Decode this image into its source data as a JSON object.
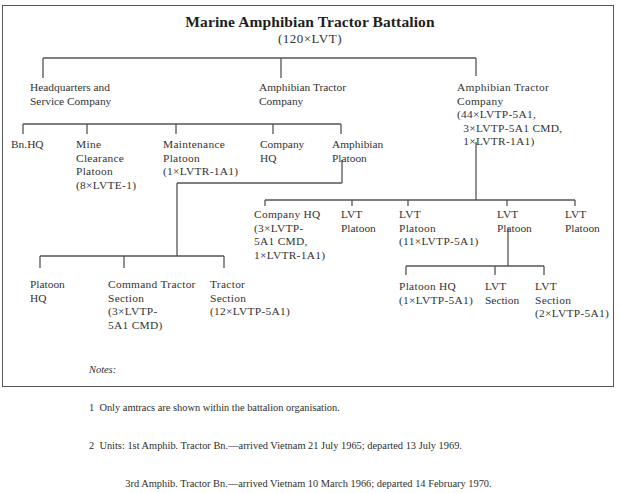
{
  "diagram": {
    "title": "Marine Amphibian Tractor Battalion",
    "subtitle": "(120×LVT)",
    "level1": [
      {
        "id": "hq_service_company",
        "label": "Headquarters and\nService Company"
      },
      {
        "id": "amphib_tractor_company_a",
        "label": "Amphibian Tractor\nCompany"
      },
      {
        "id": "amphib_tractor_company_b",
        "label": "Amphibian Tractor\nCompany\n(44×LVTP-5A1,\n  3×LVTP-5A1 CMD,\n  1×LVTR-1A1)"
      }
    ],
    "level2_hq_service": [
      {
        "id": "bn_hq",
        "label": "Bn.HQ"
      },
      {
        "id": "mine_clearance_platoon",
        "label": "Mine\nClearance\nPlatoon\n(8×LVTE-1)"
      },
      {
        "id": "maintenance_platoon",
        "label": "Maintenance\nPlatoon\n(1×LVTR-1A1)"
      },
      {
        "id": "company_hq_a",
        "label": "Company\nHQ"
      },
      {
        "id": "amphibian_platoon",
        "label": "Amphibian\nPlatoon"
      }
    ],
    "level2_company_b": [
      {
        "id": "company_hq_b",
        "label": "Company HQ\n(3×LVTP-\n5A1 CMD,\n1×LVTR-1A1)"
      },
      {
        "id": "lvt_platoon_1",
        "label": "LVT\nPlatoon"
      },
      {
        "id": "lvt_platoon_2",
        "label": "LVT\nPlatoon\n(11×LVTP-5A1)"
      },
      {
        "id": "lvt_platoon_3",
        "label": "LVT\nPlatoon"
      },
      {
        "id": "lvt_platoon_4",
        "label": "LVT\nPlatoon"
      }
    ],
    "level3_amphibian_platoon": [
      {
        "id": "platoon_hq_a",
        "label": "Platoon\nHQ"
      },
      {
        "id": "command_tractor_section",
        "label": "Command Tractor\nSection\n(3×LVTP-\n5A1 CMD)"
      },
      {
        "id": "tractor_section",
        "label": "Tractor\nSection\n(12×LVTP-5A1)"
      }
    ],
    "level3_lvt_platoon": [
      {
        "id": "platoon_hq_b",
        "label": "Platoon HQ\n(1×LVTP-5A1)"
      },
      {
        "id": "lvt_section_1",
        "label": "LVT\nSection"
      },
      {
        "id": "lvt_section_2",
        "label": "LVT\nSection\n(2×LVTP-5A1)"
      }
    ]
  },
  "notes": {
    "heading": "Notes:",
    "items": [
      "1  Only amtracs are shown within the battalion organisation.",
      "2  Units: 1st Amphib. Tractor Bn.—arrived Vietnam 21 July 1965; departed 13 July 1969.",
      "              3rd Amphib. Tractor Bn.—arrived Vietnam 10 March 1966; departed 14 February 1970."
    ]
  },
  "colors": {
    "line": "#555555",
    "text": "#333333",
    "background": "#ffffff"
  }
}
